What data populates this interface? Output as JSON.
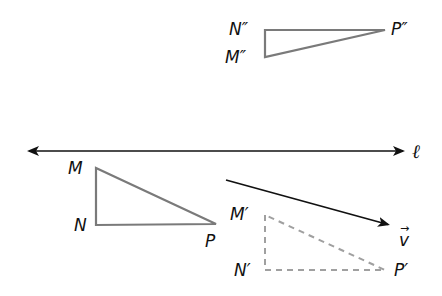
{
  "diagram": {
    "title": "",
    "colors": {
      "triangle_stroke": "#7a7a7a",
      "image_dashed_stroke": "#a0a0a0",
      "line_stroke": "#111111",
      "vector_stroke": "#111111",
      "label_color": "#111111"
    },
    "line": {
      "label": "ℓ",
      "from": [
        27,
        151
      ],
      "to": [
        405,
        151
      ],
      "arrowheads": "both"
    },
    "vector": {
      "label": "v",
      "arrow_glyph": "→",
      "from": [
        226,
        180
      ],
      "to": [
        390,
        225
      ]
    },
    "triangles": [
      {
        "name": "MNP",
        "style": "solid",
        "vertices": [
          {
            "label": "M",
            "point": [
              96,
              168
            ]
          },
          {
            "label": "N",
            "point": [
              96,
              225
            ]
          },
          {
            "label": "P",
            "point": [
              216,
              224
            ]
          }
        ]
      },
      {
        "name": "M'N'P'",
        "style": "dashed",
        "vertices": [
          {
            "label": "M′",
            "point": [
              265,
              215
            ]
          },
          {
            "label": "N′",
            "point": [
              265,
              270
            ]
          },
          {
            "label": "P′",
            "point": [
              385,
              270
            ]
          }
        ]
      },
      {
        "name": "M''N''P''",
        "style": "solid",
        "vertices": [
          {
            "label": "N″",
            "point": [
              265,
              30
            ]
          },
          {
            "label": "M″",
            "point": [
              265,
              57
            ]
          },
          {
            "label": "P″",
            "point": [
              385,
              30
            ]
          }
        ]
      }
    ]
  }
}
